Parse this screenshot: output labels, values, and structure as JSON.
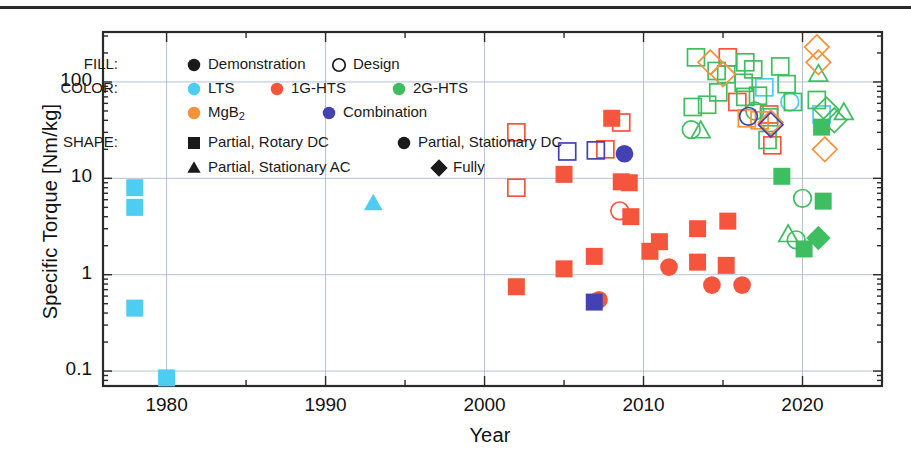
{
  "chart_data": {
    "type": "scatter",
    "title": "",
    "xlabel": "Year",
    "ylabel": "Specific Torque [Nm/kg]",
    "xlim": [
      1976,
      2025
    ],
    "ylim": [
      0.07,
      330
    ],
    "yscale": "log",
    "xticks": [
      1980,
      1990,
      2000,
      2010,
      2020
    ],
    "ytick_labels": [
      "0.1",
      "1",
      "10",
      "100"
    ],
    "yticks": [
      0.1,
      1,
      10,
      100
    ],
    "grid": true,
    "legend_position": "upper-left-inside",
    "encoding": {
      "fill_meaning": "Demonstration = filled marker, Design = open marker",
      "color_meaning": "superconductor material",
      "shape_meaning": "machine superconducting topology"
    },
    "colors": {
      "LTS": "#4ECDF2",
      "1G-HTS": "#F4553C",
      "2G-HTS": "#3EBE60",
      "MgB2": "#F5923C",
      "Combination": "#4242B4"
    },
    "series": [
      {
        "name": "LTS",
        "color": "#4ECDF2",
        "points": [
          {
            "x": 1978.0,
            "y": 8.0,
            "shape": "square",
            "fill": "filled"
          },
          {
            "x": 1978.0,
            "y": 5.0,
            "shape": "square",
            "fill": "filled"
          },
          {
            "x": 1978.0,
            "y": 0.45,
            "shape": "square",
            "fill": "filled"
          },
          {
            "x": 1980.0,
            "y": 0.085,
            "shape": "square",
            "fill": "filled"
          },
          {
            "x": 1993.0,
            "y": 5.5,
            "shape": "triangle",
            "fill": "filled"
          },
          {
            "x": 2017.6,
            "y": 88.0,
            "shape": "square",
            "fill": "open"
          },
          {
            "x": 2019.2,
            "y": 62.0,
            "shape": "circle",
            "fill": "open"
          },
          {
            "x": 2021.2,
            "y": 46.0,
            "shape": "square",
            "fill": "open"
          }
        ]
      },
      {
        "name": "1G-HTS",
        "color": "#F4553C",
        "points": [
          {
            "x": 2002.0,
            "y": 30.0,
            "shape": "square",
            "fill": "open"
          },
          {
            "x": 2002.0,
            "y": 8.0,
            "shape": "square",
            "fill": "open"
          },
          {
            "x": 2002.0,
            "y": 0.75,
            "shape": "square",
            "fill": "filled"
          },
          {
            "x": 2005.0,
            "y": 11.0,
            "shape": "square",
            "fill": "filled"
          },
          {
            "x": 2005.0,
            "y": 1.15,
            "shape": "square",
            "fill": "filled"
          },
          {
            "x": 2006.9,
            "y": 1.55,
            "shape": "square",
            "fill": "filled"
          },
          {
            "x": 2007.2,
            "y": 0.55,
            "shape": "circle",
            "fill": "filled"
          },
          {
            "x": 2007.6,
            "y": 20.0,
            "shape": "square",
            "fill": "open"
          },
          {
            "x": 2008.0,
            "y": 42.0,
            "shape": "square",
            "fill": "filled"
          },
          {
            "x": 2008.6,
            "y": 38.0,
            "shape": "square",
            "fill": "open"
          },
          {
            "x": 2008.6,
            "y": 9.2,
            "shape": "square",
            "fill": "filled"
          },
          {
            "x": 2009.1,
            "y": 9.0,
            "shape": "square",
            "fill": "filled"
          },
          {
            "x": 2008.5,
            "y": 4.6,
            "shape": "circle",
            "fill": "open"
          },
          {
            "x": 2009.2,
            "y": 4.0,
            "shape": "square",
            "fill": "filled"
          },
          {
            "x": 2011.0,
            "y": 2.2,
            "shape": "square",
            "fill": "filled"
          },
          {
            "x": 2010.4,
            "y": 1.75,
            "shape": "square",
            "fill": "filled"
          },
          {
            "x": 2011.6,
            "y": 1.2,
            "shape": "circle",
            "fill": "filled"
          },
          {
            "x": 2013.4,
            "y": 3.0,
            "shape": "square",
            "fill": "filled"
          },
          {
            "x": 2013.4,
            "y": 1.35,
            "shape": "square",
            "fill": "filled"
          },
          {
            "x": 2014.3,
            "y": 0.78,
            "shape": "circle",
            "fill": "filled"
          },
          {
            "x": 2015.3,
            "y": 3.6,
            "shape": "square",
            "fill": "filled"
          },
          {
            "x": 2015.2,
            "y": 1.25,
            "shape": "square",
            "fill": "filled"
          },
          {
            "x": 2016.2,
            "y": 0.78,
            "shape": "circle",
            "fill": "filled"
          },
          {
            "x": 2015.3,
            "y": 180.0,
            "shape": "square",
            "fill": "open"
          },
          {
            "x": 2015.9,
            "y": 62.0,
            "shape": "square",
            "fill": "open"
          },
          {
            "x": 2017.9,
            "y": 46.0,
            "shape": "square",
            "fill": "open"
          },
          {
            "x": 2018.1,
            "y": 22.0,
            "shape": "square",
            "fill": "open"
          }
        ]
      },
      {
        "name": "2G-HTS",
        "color": "#3EBE60",
        "points": [
          {
            "x": 2013.3,
            "y": 180.0,
            "shape": "square",
            "fill": "open"
          },
          {
            "x": 2014.6,
            "y": 130.0,
            "shape": "square",
            "fill": "open"
          },
          {
            "x": 2015.2,
            "y": 120.0,
            "shape": "square",
            "fill": "open"
          },
          {
            "x": 2014.7,
            "y": 78.0,
            "shape": "square",
            "fill": "open"
          },
          {
            "x": 2014.0,
            "y": 58.0,
            "shape": "square",
            "fill": "open"
          },
          {
            "x": 2013.1,
            "y": 55.0,
            "shape": "square",
            "fill": "open"
          },
          {
            "x": 2013.0,
            "y": 32.0,
            "shape": "circle",
            "fill": "open"
          },
          {
            "x": 2013.6,
            "y": 31.0,
            "shape": "triangle",
            "fill": "open"
          },
          {
            "x": 2016.4,
            "y": 160.0,
            "shape": "square",
            "fill": "open"
          },
          {
            "x": 2016.9,
            "y": 135.0,
            "shape": "square",
            "fill": "open"
          },
          {
            "x": 2016.3,
            "y": 98.0,
            "shape": "square",
            "fill": "open"
          },
          {
            "x": 2016.4,
            "y": 70.0,
            "shape": "square",
            "fill": "open"
          },
          {
            "x": 2017.2,
            "y": 72.0,
            "shape": "square",
            "fill": "open"
          },
          {
            "x": 2017.0,
            "y": 50.0,
            "shape": "circle",
            "fill": "open"
          },
          {
            "x": 2017.9,
            "y": 43.0,
            "shape": "square",
            "fill": "open"
          },
          {
            "x": 2017.8,
            "y": 25.0,
            "shape": "square",
            "fill": "open"
          },
          {
            "x": 2018.6,
            "y": 145.0,
            "shape": "square",
            "fill": "open"
          },
          {
            "x": 2019.0,
            "y": 95.0,
            "shape": "square",
            "fill": "open"
          },
          {
            "x": 2019.4,
            "y": 62.0,
            "shape": "square",
            "fill": "open"
          },
          {
            "x": 2021.0,
            "y": 120.0,
            "shape": "triangle",
            "fill": "open"
          },
          {
            "x": 2020.9,
            "y": 65.0,
            "shape": "square",
            "fill": "open"
          },
          {
            "x": 2021.5,
            "y": 52.0,
            "shape": "diamond",
            "fill": "open"
          },
          {
            "x": 2022.0,
            "y": 40.0,
            "shape": "diamond",
            "fill": "open"
          },
          {
            "x": 2022.6,
            "y": 48.0,
            "shape": "triangle",
            "fill": "open"
          },
          {
            "x": 2021.2,
            "y": 34.0,
            "shape": "square",
            "fill": "filled"
          },
          {
            "x": 2018.7,
            "y": 10.5,
            "shape": "square",
            "fill": "filled"
          },
          {
            "x": 2020.0,
            "y": 6.2,
            "shape": "circle",
            "fill": "open"
          },
          {
            "x": 2021.3,
            "y": 5.8,
            "shape": "square",
            "fill": "filled"
          },
          {
            "x": 2019.1,
            "y": 2.6,
            "shape": "triangle",
            "fill": "open"
          },
          {
            "x": 2019.6,
            "y": 2.3,
            "shape": "circle",
            "fill": "open"
          },
          {
            "x": 2020.1,
            "y": 1.85,
            "shape": "square",
            "fill": "filled"
          },
          {
            "x": 2021.0,
            "y": 2.4,
            "shape": "diamond",
            "fill": "filled"
          }
        ]
      },
      {
        "name": "MgB2",
        "color": "#F5923C",
        "points": [
          {
            "x": 2014.2,
            "y": 160.0,
            "shape": "diamond",
            "fill": "open"
          },
          {
            "x": 2015.0,
            "y": 120.0,
            "shape": "diamond",
            "fill": "open"
          },
          {
            "x": 2016.5,
            "y": 42.0,
            "shape": "square",
            "fill": "open"
          },
          {
            "x": 2017.3,
            "y": 40.0,
            "shape": "square",
            "fill": "open"
          },
          {
            "x": 2018.0,
            "y": 38.0,
            "shape": "diamond",
            "fill": "open"
          },
          {
            "x": 2020.9,
            "y": 230.0,
            "shape": "diamond",
            "fill": "open"
          },
          {
            "x": 2021.0,
            "y": 160.0,
            "shape": "diamond",
            "fill": "open"
          },
          {
            "x": 2021.4,
            "y": 20.0,
            "shape": "diamond",
            "fill": "open"
          }
        ]
      },
      {
        "name": "Combination",
        "color": "#4242B4",
        "points": [
          {
            "x": 2005.2,
            "y": 19.0,
            "shape": "square",
            "fill": "open"
          },
          {
            "x": 2007.0,
            "y": 19.5,
            "shape": "square",
            "fill": "open"
          },
          {
            "x": 2008.8,
            "y": 18.0,
            "shape": "circle",
            "fill": "filled"
          },
          {
            "x": 2006.9,
            "y": 0.52,
            "shape": "square",
            "fill": "filled"
          },
          {
            "x": 2016.6,
            "y": 44.0,
            "shape": "circle",
            "fill": "open"
          },
          {
            "x": 2018.0,
            "y": 36.0,
            "shape": "diamond",
            "fill": "open"
          }
        ]
      }
    ]
  },
  "legend": {
    "rows": [
      {
        "caption": "FILL:",
        "items": [
          {
            "label": "Demonstration",
            "shape": "circle",
            "fill": "filled",
            "color": "#1a1a1a"
          },
          {
            "label": "Design",
            "shape": "circle",
            "fill": "open",
            "color": "#1a1a1a"
          }
        ]
      },
      {
        "caption": "COLOR:",
        "items": [
          {
            "label": "LTS",
            "shape": "circle",
            "fill": "filled",
            "color": "#4ECDF2"
          },
          {
            "label": "1G-HTS",
            "shape": "circle",
            "fill": "filled",
            "color": "#F4553C"
          },
          {
            "label": "2G-HTS",
            "shape": "circle",
            "fill": "filled",
            "color": "#3EBE60"
          }
        ]
      },
      {
        "caption": "",
        "items": [
          {
            "label": "MgB2",
            "sub": "2",
            "base": "MgB",
            "shape": "circle",
            "fill": "filled",
            "color": "#F5923C"
          },
          {
            "label": "Combination",
            "shape": "circle",
            "fill": "filled",
            "color": "#4242B4"
          }
        ]
      },
      {
        "caption": "SHAPE:",
        "items": [
          {
            "label": "Partial, Rotary DC",
            "shape": "square",
            "fill": "filled",
            "color": "#1a1a1a"
          },
          {
            "label": "Partial, Stationary DC",
            "shape": "circle",
            "fill": "filled",
            "color": "#1a1a1a"
          }
        ]
      },
      {
        "caption": "",
        "items": [
          {
            "label": "Partial, Stationary AC",
            "shape": "triangle",
            "fill": "filled",
            "color": "#1a1a1a"
          },
          {
            "label": "Fully",
            "shape": "diamond",
            "fill": "filled",
            "color": "#1a1a1a"
          }
        ]
      }
    ]
  }
}
